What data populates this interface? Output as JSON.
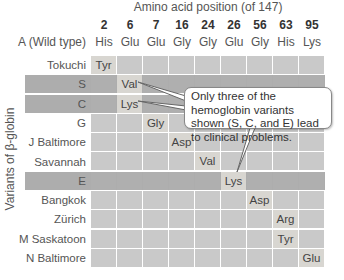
{
  "title": "Amino acid position (of 147)",
  "y_axis_label": "Variants of β-globin",
  "positions": [
    "2",
    "6",
    "7",
    "16",
    "24",
    "26",
    "56",
    "63",
    "95"
  ],
  "wild_type": {
    "label": "A (Wild type)",
    "residues": [
      "His",
      "Glu",
      "Glu",
      "Gly",
      "Gly",
      "Glu",
      "Gly",
      "His",
      "Lys"
    ]
  },
  "variants": [
    {
      "name": "Tokuchi",
      "dark": false,
      "cells": [
        "Tyr",
        "",
        "",
        "",
        "",
        "",
        "",
        "",
        ""
      ]
    },
    {
      "name": "S",
      "dark": true,
      "cells": [
        "",
        "Val",
        "",
        "",
        "",
        "",
        "",
        "",
        ""
      ]
    },
    {
      "name": "C",
      "dark": true,
      "cells": [
        "",
        "Lys",
        "",
        "",
        "",
        "",
        "",
        "",
        ""
      ]
    },
    {
      "name": "G",
      "dark": false,
      "cells": [
        "",
        "",
        "Gly",
        "",
        "",
        "",
        "",
        "",
        ""
      ]
    },
    {
      "name": "J Baltimore",
      "dark": false,
      "cells": [
        "",
        "",
        "",
        "Asp",
        "",
        "",
        "",
        "",
        ""
      ]
    },
    {
      "name": "Savannah",
      "dark": false,
      "cells": [
        "",
        "",
        "",
        "",
        "Val",
        "",
        "",
        "",
        ""
      ]
    },
    {
      "name": "E",
      "dark": true,
      "cells": [
        "",
        "",
        "",
        "",
        "",
        "Lys",
        "",
        "",
        ""
      ]
    },
    {
      "name": "Bangkok",
      "dark": false,
      "cells": [
        "",
        "",
        "",
        "",
        "",
        "",
        "Asp",
        "",
        ""
      ]
    },
    {
      "name": "Zürich",
      "dark": false,
      "cells": [
        "",
        "",
        "",
        "",
        "",
        "",
        "",
        "Arg",
        ""
      ]
    },
    {
      "name": "M Saskatoon",
      "dark": false,
      "cells": [
        "",
        "",
        "",
        "",
        "",
        "",
        "",
        "Tyr",
        ""
      ]
    },
    {
      "name": "N Baltimore",
      "dark": false,
      "cells": [
        "",
        "",
        "",
        "",
        "",
        "",
        "",
        "",
        "Glu"
      ]
    }
  ],
  "callout": {
    "text": "Only three of the hemoglobin variants shown (S, C, and E) lead to clinical problems."
  },
  "colors": {
    "cell": "#c9c9c9",
    "dark_band": "#afafaf",
    "mutation_cell": "#d8d6d1"
  }
}
